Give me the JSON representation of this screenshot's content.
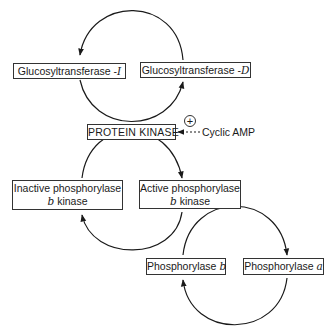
{
  "diagram": {
    "nodes": {
      "glucosyltransferase_i": {
        "label": "Glucosyltransferase -",
        "suffix": "I"
      },
      "glucosyltransferase_d": {
        "label": "Glucosyltransferase -",
        "suffix": "D"
      },
      "protein_kinase": {
        "label": "PROTEIN KINASE"
      },
      "inactive_phosphorylase_b_kinase": {
        "line1": "Inactive phosphorylase",
        "line2_italic": "b",
        "line2": " kinase"
      },
      "active_phosphorylase_b_kinase": {
        "line1": "Active phosphorylase",
        "line2_italic": "b",
        "line2": " kinase"
      },
      "phosphorylase_b": {
        "label": "Phosphorylase ",
        "suffix": "b"
      },
      "phosphorylase_a": {
        "label": "Phosphorylase ",
        "suffix": "a"
      }
    },
    "activator": {
      "label": "Cyclic AMP",
      "sign": "+"
    },
    "edges": [
      {
        "from": "glucosyltransferase_d",
        "to": "glucosyltransferase_i",
        "via": "top arc"
      },
      {
        "from": "glucosyltransferase_i",
        "to": "glucosyltransferase_d",
        "via": "bottom arc"
      },
      {
        "from": "inactive_phosphorylase_b_kinase",
        "to": "active_phosphorylase_b_kinase",
        "via": "top arc"
      },
      {
        "from": "active_phosphorylase_b_kinase",
        "to": "inactive_phosphorylase_b_kinase",
        "via": "bottom arc"
      },
      {
        "from": "phosphorylase_b",
        "to": "phosphorylase_a",
        "via": "top arc"
      },
      {
        "from": "phosphorylase_a",
        "to": "phosphorylase_b",
        "via": "bottom arc"
      },
      {
        "from": "cyclic_amp",
        "to": "protein_kinase",
        "style": "dashed",
        "effect": "activates"
      }
    ]
  }
}
